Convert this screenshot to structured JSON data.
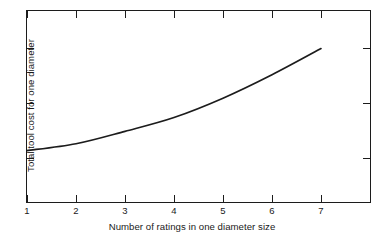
{
  "chart_data": {
    "type": "line",
    "title": "",
    "xlabel": "Number of ratings in one diameter size",
    "ylabel": "Total tool cost for one diameter",
    "x": [
      1,
      2,
      3,
      4,
      5,
      6,
      7
    ],
    "values": [
      0.38,
      0.43,
      0.52,
      0.62,
      0.76,
      0.93,
      1.12
    ],
    "series": [
      {
        "name": "Total tool cost",
        "x": [
          1,
          2,
          3,
          4,
          5,
          6,
          7
        ],
        "values": [
          0.38,
          0.43,
          0.52,
          0.62,
          0.76,
          0.93,
          1.12
        ]
      }
    ],
    "xticklabels": [
      "1",
      "2",
      "3",
      "4",
      "5",
      "6",
      "7"
    ],
    "yticklabels": [
      "",
      "",
      ""
    ],
    "xlim": [
      1,
      8
    ],
    "ylim": [
      0,
      1.4
    ],
    "grid": false,
    "legend": null,
    "annotations": [],
    "line_color": "#1c1c1c",
    "frame_color": "#1c1c1c",
    "background_color": "#ffffff",
    "n_y_ticks": 3
  },
  "axes": {
    "x_title": "Number of ratings in one diameter size",
    "y_title": "Total tool cost for one diameter",
    "x_ticks": [
      {
        "label": "1",
        "px": 27
      },
      {
        "label": "2",
        "px": 76
      },
      {
        "label": "3",
        "px": 125
      },
      {
        "label": "4",
        "px": 174
      },
      {
        "label": "5",
        "px": 223
      },
      {
        "label": "6",
        "px": 272
      },
      {
        "label": "7",
        "px": 321
      }
    ],
    "y_ticks": [
      {
        "label": "",
        "px": 47
      },
      {
        "label": "",
        "px": 102
      },
      {
        "label": "",
        "px": 157
      }
    ]
  }
}
